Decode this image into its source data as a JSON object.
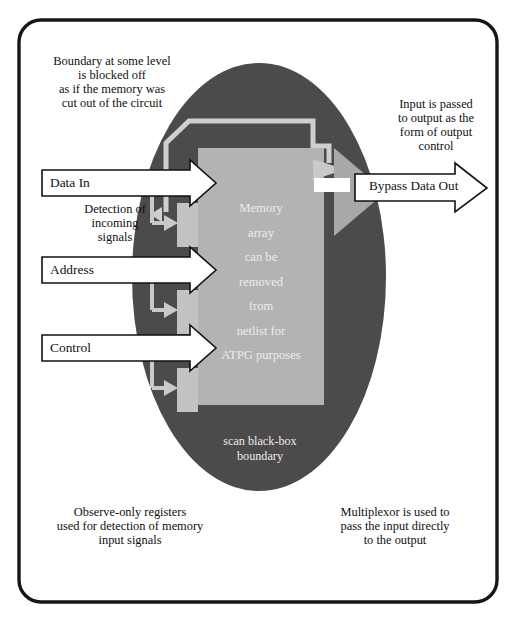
{
  "figure": {
    "colors": {
      "page_background": "#ffffff",
      "frame_border": "#161616",
      "blackbox_fill": "#4c4a4a",
      "memory_fill": "#b3b3b3",
      "boundary_line": "#cfcfcf",
      "register_fill": "#c2c2c2",
      "mux_fill": "#a8a8a8",
      "arrow_fill": "#ffffff",
      "arrow_stroke": "#111111",
      "tap_arrow_fill": "#c9c9c9",
      "text_dark": "#100f0f",
      "text_light": "#ececec"
    }
  },
  "annotations": {
    "top_left_note": "Boundary at some level\nis blocked off\nas if the memory was\ncut out of the circuit",
    "top_right_note": "Input is passed\nto output as the\nform of output\ncontrol",
    "detection_note": "Detection of\nincoming\nsignals",
    "bottom_left_note": "Observe-only registers\nused for detection of memory\ninput signals",
    "bottom_right_note": "Multiplexor is used to\npass the input directly\nto the output",
    "blackbox_caption": "scan black-box\nboundary"
  },
  "inputs": [
    {
      "label": "Data In",
      "name": "data-in"
    },
    {
      "label": "Address",
      "name": "address"
    },
    {
      "label": "Control",
      "name": "control"
    }
  ],
  "outputs": [
    {
      "label": "Bypass Data Out",
      "name": "bypass-data-out"
    }
  ],
  "memory_block": {
    "lines": [
      "Memory",
      "array",
      "can be",
      "removed",
      "from",
      "netlist for",
      "ATPG purposes"
    ],
    "text": "Memory\narray\ncan be\nremoved\nfrom\nnetlist for\nATPG purposes"
  },
  "registers": [
    {
      "name": "observe-register-data-in"
    },
    {
      "name": "observe-register-address"
    },
    {
      "name": "observe-register-control"
    }
  ]
}
